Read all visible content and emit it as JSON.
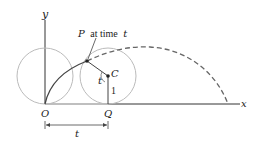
{
  "diagram": {
    "type": "cycloid",
    "labels": {
      "y_axis": "y",
      "x_axis": "x",
      "origin": "O",
      "contact_point": "Q",
      "center": "C",
      "point_p": "P",
      "point_p_suffix": "at time",
      "point_p_time": "t",
      "angle": "t",
      "radius": "1",
      "distance": "t"
    },
    "colors": {
      "axis": "#333333",
      "circle": "#bbbbbb",
      "curve": "#444444",
      "dashed": "#666666"
    }
  }
}
